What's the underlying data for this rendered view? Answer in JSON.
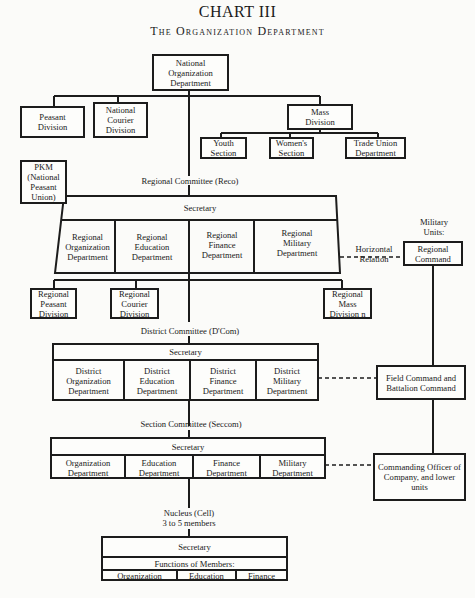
{
  "title": "CHART III",
  "subtitle": "The Organization Department",
  "national": {
    "root": "National Organization Department",
    "children": [
      {
        "label": "Peasant Division"
      },
      {
        "label": "National Courier Division"
      },
      {
        "label": "Mass Division"
      }
    ],
    "mass_sections": [
      {
        "label": "Youth Section"
      },
      {
        "label": "Women's Section"
      },
      {
        "label": "Trade Union Department"
      }
    ],
    "pkm": "PKM (National Peasant Union)"
  },
  "regional": {
    "committee_label": "Regional Committee (Reco)",
    "secretary": "Secretary",
    "departments": [
      {
        "label": "Regional Organization Department"
      },
      {
        "label": "Regional Education Department"
      },
      {
        "label": "Regional Finance Department"
      },
      {
        "label": "Regional Military Department"
      }
    ],
    "divisions": [
      {
        "label": "Regional Peasant Division"
      },
      {
        "label": "Regional Courier Division"
      },
      {
        "label": "Regional Mass Division n"
      }
    ],
    "horizontal_relation": "Horizontal Relation"
  },
  "military": {
    "header": "Military Units:",
    "regional_command": "Regional Command",
    "field_command": "Field Command and Battalion Command",
    "company": "Commanding Officer of Company, and lower units"
  },
  "district": {
    "committee_label": "District Committee (D'Com)",
    "secretary": "Secretary",
    "departments": [
      {
        "label": "District Organization Department"
      },
      {
        "label": "District Education Department"
      },
      {
        "label": "District Finance Department"
      },
      {
        "label": "District Military Department"
      }
    ]
  },
  "section": {
    "committee_label": "Section Committee (Seccom)",
    "secretary": "Secretary",
    "departments": [
      {
        "label": "Organization Department"
      },
      {
        "label": "Education Department"
      },
      {
        "label": "Finance Department"
      },
      {
        "label": "Military Department"
      }
    ]
  },
  "cell": {
    "label_line1": "Nucleus (Cell)",
    "label_line2": "3 to 5 members",
    "secretary": "Secretary",
    "functions_label": "Functions of Members:",
    "functions": [
      {
        "label": "Organization"
      },
      {
        "label": "Education"
      },
      {
        "label": "Finance"
      }
    ]
  }
}
